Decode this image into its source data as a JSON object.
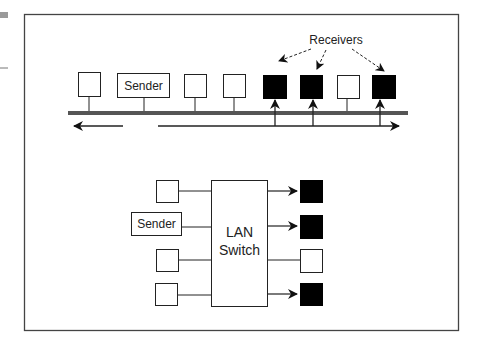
{
  "colors": {
    "line": "#333333",
    "bus": "#555555",
    "receiver_fill": "#000000",
    "node_fill": "#ffffff",
    "margin_block": "#9a9a9a"
  },
  "shared_media": {
    "receivers_label": "Receivers",
    "sender_label": "Sender",
    "nodes": [
      {
        "type": "station",
        "receiver": false
      },
      {
        "type": "sender",
        "receiver": false
      },
      {
        "type": "station",
        "receiver": false
      },
      {
        "type": "station",
        "receiver": false
      },
      {
        "type": "station",
        "receiver": true
      },
      {
        "type": "station",
        "receiver": true
      },
      {
        "type": "station",
        "receiver": false
      },
      {
        "type": "station",
        "receiver": true
      }
    ]
  },
  "switched": {
    "switch_label_line1": "LAN",
    "switch_label_line2": "Switch",
    "sender_label": "Sender",
    "left_ports": [
      "station",
      "sender",
      "station",
      "station"
    ],
    "right_ports": [
      {
        "receiver": true
      },
      {
        "receiver": true
      },
      {
        "receiver": false
      },
      {
        "receiver": true
      }
    ]
  }
}
